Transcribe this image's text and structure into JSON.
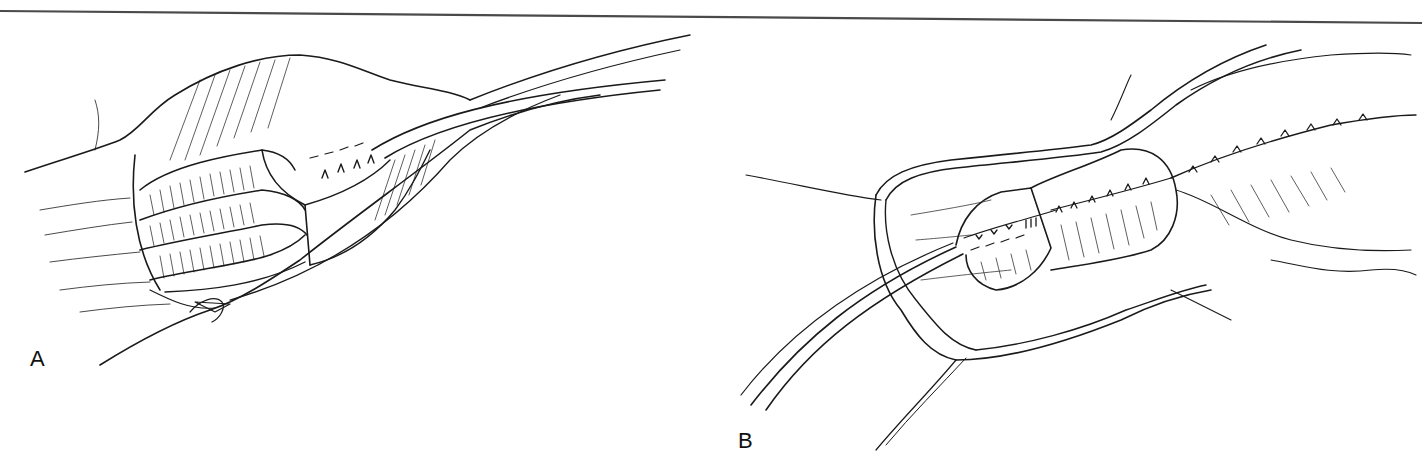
{
  "figure": {
    "panels": [
      {
        "id": "A",
        "label": "A",
        "subject": "surgical-illustration-panel-a"
      },
      {
        "id": "B",
        "label": "B",
        "subject": "surgical-illustration-panel-b"
      }
    ]
  },
  "colors": {
    "line": "#1a1a1a",
    "background": "#ffffff",
    "rule": "#4a4a4a"
  }
}
